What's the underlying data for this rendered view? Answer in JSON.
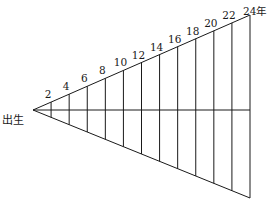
{
  "diagram": {
    "origin_label": "出生",
    "end_label": "24年",
    "tick_labels": [
      "2",
      "4",
      "6",
      "8",
      "10",
      "12",
      "14",
      "16",
      "18",
      "20",
      "22"
    ],
    "line_color": "#1a1a1a",
    "background": "#ffffff"
  }
}
